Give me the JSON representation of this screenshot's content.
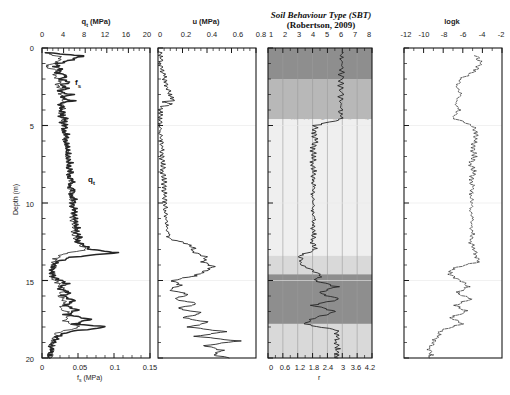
{
  "figure": {
    "ylabel": "Depth (m)",
    "ydomain": [
      0,
      20
    ],
    "yticks": [
      0,
      5,
      10,
      15,
      20
    ],
    "yminor_step": 1
  },
  "panels": {
    "qt": {
      "top_title": "q",
      "top_title_sub": "t",
      "top_title_unit": " (MPa)",
      "top_ticks": [
        "0",
        "4",
        "8",
        "12",
        "16",
        "20"
      ],
      "top_range": [
        0,
        20
      ],
      "bottom_title": "f",
      "bottom_title_sub": "s",
      "bottom_title_unit": " (MPa)",
      "bottom_ticks": [
        "0",
        "0.05",
        "0.1",
        "0.15"
      ],
      "bottom_range": [
        0,
        0.15
      ],
      "curve_label_qt": "q",
      "curve_label_qt_sub": "t",
      "curve_label_fs": "f",
      "curve_label_fs_sub": "s"
    },
    "u": {
      "top_title": "u (MPa)",
      "top_ticks": [
        "0",
        "0.2",
        "0.4",
        "0.6",
        "0.8"
      ],
      "top_range": [
        0,
        0.8
      ]
    },
    "sbt": {
      "title_line1": "Soil Behaviour Type (SBT)",
      "title_line2": "(Robertson, 2009)",
      "top_ticks": [
        "1",
        "2",
        "3",
        "4",
        "5",
        "6",
        "7",
        "8"
      ],
      "top_range": [
        1,
        8
      ],
      "bottom_ticks": [
        "0",
        "0.6",
        "1.2",
        "1.8",
        "2.4",
        "3",
        "3.6",
        "4.2"
      ],
      "bottom_range": [
        0,
        4.2
      ],
      "bottom_axis_name": "r",
      "zone_labels": [
        "Organic soils peats",
        "Clay to silty clay",
        "Clayey silt to silty clay",
        "Silty sand to sandy silt",
        "Clean sands to silty sands",
        "Gravelly sands"
      ]
    },
    "logk": {
      "top_title": "logk",
      "top_ticks": [
        "-12",
        "-10",
        "-8",
        "-6",
        "-4",
        "-2"
      ],
      "top_range": [
        -12,
        -2
      ]
    }
  },
  "colors": {
    "axis": "#1a1a1a",
    "curve": "#262626",
    "band_dark": "#8e8e8e",
    "band_mid": "#b8b8b8",
    "band_light": "#d9d9d9",
    "band_pale": "#efefef",
    "background": "#ffffff"
  },
  "chart_data": {
    "type": "line",
    "ylabel": "Depth (m)",
    "ylim": [
      0,
      20
    ],
    "axis_inverted_y": true,
    "panels": [
      {
        "name": "qt_fs",
        "xlabel_top": "qt (MPa)",
        "xlim_top": [
          0,
          20
        ],
        "xticks_top": [
          0,
          4,
          8,
          12,
          16,
          20
        ],
        "xlabel_bottom": "fs (MPa)",
        "xlim_bottom": [
          0,
          0.15
        ],
        "xticks_bottom": [
          0,
          0.05,
          0.1,
          0.15
        ],
        "series": [
          {
            "name": "qt",
            "depth": [
              0.3,
              0.5,
              0.8,
              1.0,
              1.2,
              1.4,
              1.6,
              1.8,
              2.0,
              2.2,
              2.4,
              2.6,
              2.8,
              3.0,
              3.2,
              3.4,
              3.6,
              3.8,
              4.0,
              4.2,
              4.4,
              4.6,
              4.8,
              5.0,
              5.3,
              5.6,
              5.9,
              6.2,
              6.5,
              6.8,
              7.1,
              7.4,
              7.7,
              8.0,
              8.3,
              8.6,
              8.9,
              9.2,
              9.5,
              9.8,
              10.1,
              10.4,
              10.7,
              11.0,
              11.3,
              11.6,
              11.9,
              12.2,
              12.5,
              12.8,
              13.0,
              13.2,
              13.5,
              13.8,
              14.0,
              14.2,
              14.5,
              14.8,
              15.0,
              15.2,
              15.5,
              15.8,
              16.0,
              16.3,
              16.6,
              16.9,
              17.2,
              17.5,
              17.8,
              18.0,
              18.3,
              18.6,
              18.9,
              19.2,
              19.5,
              19.8,
              20.0
            ],
            "values": [
              0.4,
              7.5,
              5.2,
              3.0,
              2.6,
              3.5,
              2.8,
              4.5,
              3.2,
              5.0,
              3.4,
              4.6,
              3.0,
              5.4,
              3.6,
              5.8,
              3.2,
              4.0,
              3.5,
              4.2,
              3.4,
              4.6,
              3.8,
              4.3,
              4.0,
              4.6,
              4.2,
              4.8,
              4.4,
              5.0,
              4.6,
              5.2,
              4.8,
              5.4,
              5.0,
              5.6,
              5.2,
              5.8,
              5.4,
              6.0,
              5.6,
              6.2,
              5.8,
              6.4,
              6.0,
              6.6,
              6.2,
              7.0,
              6.5,
              8.0,
              9.0,
              14.0,
              5.5,
              2.5,
              2.2,
              2.0,
              1.9,
              2.0,
              3.4,
              4.6,
              3.2,
              5.0,
              3.8,
              6.2,
              4.0,
              6.8,
              4.4,
              9.0,
              6.0,
              12.0,
              5.0,
              3.0,
              2.2,
              1.8,
              1.6,
              1.5,
              1.4
            ]
          },
          {
            "name": "fs",
            "depth": [
              0.3,
              0.6,
              0.9,
              1.2,
              1.5,
              1.8,
              2.1,
              2.4,
              2.7,
              3.0,
              3.3,
              3.6,
              3.9,
              4.2,
              4.5,
              4.8,
              5.1,
              5.4,
              5.7,
              6.0,
              6.5,
              7.0,
              7.5,
              8.0,
              8.5,
              9.0,
              9.5,
              10.0,
              10.5,
              11.0,
              11.5,
              12.0,
              12.5,
              13.0,
              13.3,
              13.6,
              14.0,
              14.4,
              14.8,
              15.2,
              15.6,
              16.0,
              16.4,
              16.8,
              17.2,
              17.6,
              18.0,
              18.4,
              18.8,
              19.2,
              19.6,
              20.0
            ],
            "values": [
              0.004,
              0.028,
              0.02,
              0.006,
              0.022,
              0.018,
              0.026,
              0.02,
              0.03,
              0.024,
              0.032,
              0.026,
              0.03,
              0.026,
              0.032,
              0.028,
              0.032,
              0.03,
              0.034,
              0.032,
              0.036,
              0.034,
              0.038,
              0.036,
              0.04,
              0.038,
              0.042,
              0.04,
              0.044,
              0.042,
              0.046,
              0.044,
              0.05,
              0.06,
              0.03,
              0.018,
              0.016,
              0.015,
              0.014,
              0.022,
              0.03,
              0.024,
              0.034,
              0.026,
              0.04,
              0.03,
              0.052,
              0.02,
              0.016,
              0.014,
              0.013,
              0.012
            ]
          }
        ]
      },
      {
        "name": "u",
        "xlabel_top": "u (MPa)",
        "xlim_top": [
          0,
          0.8
        ],
        "xticks_top": [
          0,
          0.2,
          0.4,
          0.6,
          0.8
        ],
        "series": [
          {
            "name": "u",
            "depth": [
              0.2,
              0.6,
              1.0,
              1.4,
              1.8,
              2.2,
              2.6,
              3.0,
              3.2,
              3.4,
              3.5,
              3.6,
              3.8,
              4.2,
              4.6,
              5.0,
              5.5,
              6.0,
              6.5,
              7.0,
              7.5,
              8.0,
              8.5,
              9.0,
              9.5,
              10.0,
              10.5,
              11.0,
              11.5,
              12.0,
              12.3,
              12.6,
              12.9,
              13.1,
              13.3,
              13.5,
              13.8,
              14.1,
              14.4,
              14.7,
              15.0,
              15.3,
              15.6,
              15.9,
              16.2,
              16.5,
              16.8,
              17.1,
              17.4,
              17.7,
              18.0,
              18.3,
              18.6,
              18.9,
              19.2,
              19.5,
              19.8,
              20.0
            ],
            "values": [
              0.01,
              0.03,
              0.02,
              0.03,
              0.05,
              0.06,
              0.08,
              0.1,
              0.12,
              0.13,
              0.03,
              0.12,
              0.02,
              0.02,
              0.02,
              0.02,
              0.02,
              0.03,
              0.03,
              0.03,
              0.04,
              0.04,
              0.05,
              0.05,
              0.05,
              0.06,
              0.06,
              0.07,
              0.07,
              0.08,
              0.1,
              0.22,
              0.3,
              0.28,
              0.34,
              0.4,
              0.36,
              0.46,
              0.38,
              0.3,
              0.12,
              0.18,
              0.1,
              0.24,
              0.14,
              0.32,
              0.16,
              0.36,
              0.2,
              0.42,
              0.24,
              0.56,
              0.3,
              0.66,
              0.38,
              0.52,
              0.46,
              0.58
            ]
          }
        ]
      },
      {
        "name": "sbt",
        "title": "Soil Behaviour Type (SBT) (Robertson, 2009)",
        "xlim_top": [
          1,
          8
        ],
        "xticks_top": [
          1,
          2,
          3,
          4,
          5,
          6,
          7,
          8
        ],
        "xlabel_bottom": "r",
        "xlim_bottom": [
          0,
          4.2
        ],
        "xticks_bottom": [
          0,
          0.6,
          1.2,
          1.8,
          2.4,
          3,
          3.6,
          4.2
        ],
        "zone_boundaries": [
          1,
          2,
          3,
          4,
          5,
          6,
          7,
          8
        ],
        "zone_names": [
          "Organic soils peats",
          "Clay to silty clay",
          "Clayey silt to silty clay",
          "Silty sand to sandy silt",
          "Clean sands to silty sands",
          "Gravelly sands"
        ],
        "depth_bands": [
          {
            "from": 0.0,
            "to": 2.0,
            "shade": "dark"
          },
          {
            "from": 2.0,
            "to": 4.6,
            "shade": "mid"
          },
          {
            "from": 4.6,
            "to": 13.4,
            "shade": "pale"
          },
          {
            "from": 13.4,
            "to": 14.6,
            "shade": "light"
          },
          {
            "from": 14.6,
            "to": 17.8,
            "shade": "dark"
          },
          {
            "from": 17.8,
            "to": 20.0,
            "shade": "light"
          }
        ],
        "series": [
          {
            "name": "SBT index",
            "depth": [
              0.3,
              1.0,
              2.0,
              3.0,
              4.0,
              4.6,
              5.0,
              5.5,
              6.0,
              6.5,
              7.0,
              7.5,
              8.0,
              8.5,
              9.0,
              9.5,
              10.0,
              10.5,
              11.0,
              11.5,
              12.0,
              12.5,
              13.0,
              13.4,
              14.0,
              14.6,
              15.0,
              15.4,
              15.8,
              16.2,
              16.6,
              17.0,
              17.4,
              17.8,
              18.2,
              18.6,
              19.0,
              19.4,
              19.8,
              20.0
            ],
            "values": [
              6.0,
              6.0,
              5.9,
              5.9,
              5.9,
              5.9,
              4.2,
              4.1,
              4.2,
              4.0,
              4.1,
              4.0,
              4.1,
              4.0,
              4.1,
              4.0,
              4.1,
              4.0,
              4.1,
              4.0,
              4.1,
              4.0,
              4.2,
              3.2,
              3.2,
              4.6,
              4.2,
              5.6,
              4.4,
              5.8,
              4.0,
              5.6,
              4.2,
              3.4,
              5.6,
              5.7,
              5.6,
              5.7,
              5.6,
              5.7
            ]
          }
        ]
      },
      {
        "name": "logk",
        "xlabel_top": "logk",
        "xlim_top": [
          -12,
          -2
        ],
        "xticks_top": [
          -12,
          -10,
          -8,
          -6,
          -4,
          -2
        ],
        "series": [
          {
            "name": "logk",
            "depth": [
              0.5,
              1.0,
              1.5,
              2.0,
              2.5,
              3.0,
              3.5,
              4.0,
              4.5,
              5.0,
              5.5,
              6.0,
              6.5,
              7.0,
              7.5,
              8.0,
              8.5,
              9.0,
              9.5,
              10.0,
              10.5,
              11.0,
              11.5,
              12.0,
              12.5,
              13.0,
              13.4,
              13.8,
              14.2,
              14.6,
              15.0,
              15.4,
              15.8,
              16.2,
              16.6,
              17.0,
              17.4,
              17.8,
              18.2,
              18.6,
              19.0,
              19.4,
              19.8,
              20.0
            ],
            "values": [
              -4.6,
              -4.2,
              -4.8,
              -6.2,
              -6.6,
              -6.2,
              -6.8,
              -6.4,
              -7.0,
              -5.0,
              -4.6,
              -4.8,
              -5.0,
              -4.8,
              -5.2,
              -4.8,
              -5.2,
              -5.0,
              -5.2,
              -5.0,
              -5.2,
              -5.0,
              -5.2,
              -5.0,
              -5.2,
              -4.8,
              -4.6,
              -4.4,
              -7.0,
              -7.4,
              -6.2,
              -5.4,
              -6.6,
              -5.2,
              -6.8,
              -5.6,
              -7.2,
              -6.0,
              -8.2,
              -8.6,
              -9.0,
              -9.4,
              -9.2,
              -9.4
            ]
          }
        ]
      }
    ]
  }
}
